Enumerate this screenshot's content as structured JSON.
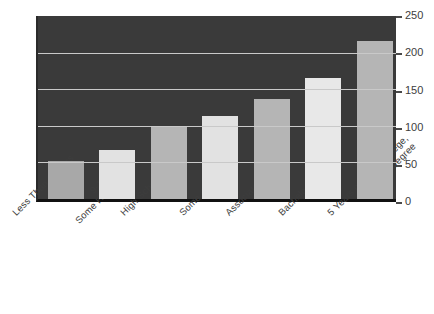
{
  "chart_data": {
    "type": "bar",
    "title": "",
    "subtitle": "",
    "xlabel": "",
    "ylabel": "",
    "ylim": [
      0,
      250
    ],
    "ytick_step": 50,
    "grid": true,
    "legend": "none",
    "categories": [
      "Less Than 9 Years",
      "9-12 Years,\nSome High School",
      "High School Degree",
      "Some College",
      "Associate's Degree",
      "Bachelor's Degree",
      "5 Years or More College,\nwith Degree"
    ],
    "values": [
      52,
      67,
      100,
      113,
      136,
      165,
      216
    ],
    "yticks": [
      0,
      50,
      100,
      150,
      200,
      250
    ],
    "ytick_labels": [
      "0",
      "50",
      "100",
      "150",
      "200",
      "250"
    ],
    "bar_colors": [
      "#a8a8a8",
      "#e2e2e2",
      "#b5b5b5",
      "#e2e2e2",
      "#b5b5b5",
      "#e8e8e8",
      "#b5b5b5"
    ],
    "plot_background": "#3a3a3a",
    "gridline_color": "#c9c9c9",
    "axis_text_color": "#3d3d3d"
  },
  "axis": {
    "ticks": [
      {
        "label": "250",
        "value": 250
      },
      {
        "label": "200",
        "value": 200
      },
      {
        "label": "150",
        "value": 150
      },
      {
        "label": "100",
        "value": 100
      },
      {
        "label": "50",
        "value": 50
      },
      {
        "label": "0",
        "value": 0
      }
    ]
  },
  "categories_display": [
    {
      "line1": "Less Than 9 Years",
      "line2": ""
    },
    {
      "line1": "9-12 Years,",
      "line2": "Some High School"
    },
    {
      "line1": "High School Degree",
      "line2": ""
    },
    {
      "line1": "Some College",
      "line2": ""
    },
    {
      "line1": "Associate's Degree",
      "line2": ""
    },
    {
      "line1": "Bachelor's Degree",
      "line2": ""
    },
    {
      "line1": "5 Years or More College,",
      "line2": "with Degree"
    }
  ]
}
